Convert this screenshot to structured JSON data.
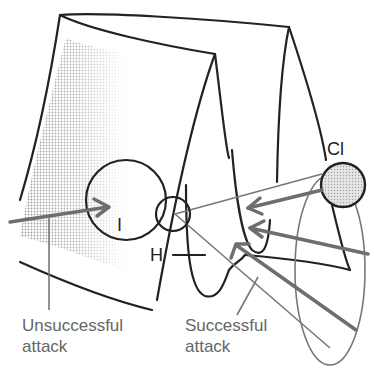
{
  "diagram": {
    "type": "potential-energy-surface-attack-diagram",
    "colors": {
      "outline": "#222222",
      "arrow": "#6e6e6e",
      "thin_line": "#777777",
      "label_text": "#666666",
      "shading": "#c8c8c8",
      "cl_fill": "#dcdcdc"
    },
    "atoms": {
      "iodine": {
        "label": "I"
      },
      "hydrogen": {
        "label": "H"
      },
      "chlorine": {
        "label": "Cl"
      }
    },
    "labels": {
      "unsuccessful": {
        "line1": "Unsuccessful",
        "line2": "attack"
      },
      "successful": {
        "line1": "Successful",
        "line2": "attack"
      }
    }
  }
}
